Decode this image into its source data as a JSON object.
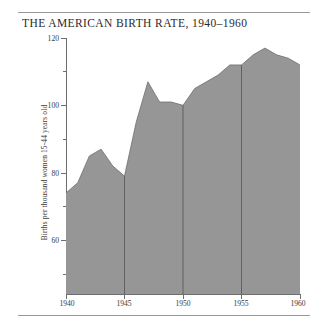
{
  "chart_data": {
    "type": "area",
    "title": "THE AMERICAN BIRTH RATE, 1940–1960",
    "xlabel": "",
    "ylabel": "Births per thousand women 15-44 years old",
    "xlim": [
      1940,
      1960
    ],
    "ylim": [
      50,
      126
    ],
    "grid": "vertical gridlines at 1945, 1950, 1955",
    "legend": "none",
    "fill_color": "#969696",
    "line_color": "#6e6e6e",
    "x_tick_labels": [
      "1940",
      "1945",
      "1950",
      "1955",
      "1960"
    ],
    "x_ticks": [
      1940,
      1945,
      1950,
      1955,
      1960
    ],
    "y_tick_labels": [
      "120",
      "100",
      "80",
      "60"
    ],
    "y_ticks": [
      120,
      100,
      80,
      60
    ],
    "y_minor_ticks": [
      110,
      90,
      70,
      50
    ],
    "x": [
      1940,
      1941,
      1942,
      1943,
      1944,
      1945,
      1946,
      1947,
      1948,
      1949,
      1950,
      1951,
      1952,
      1953,
      1954,
      1955,
      1956,
      1957,
      1958,
      1959,
      1960
    ],
    "values": [
      80,
      83,
      91,
      93,
      88,
      85,
      101,
      113,
      107,
      107,
      106,
      111,
      113,
      115,
      118,
      118,
      121,
      123,
      121,
      120,
      118
    ],
    "series": [
      {
        "name": "Births per thousand women 15-44 years old",
        "values": [
          80,
          83,
          91,
          93,
          88,
          85,
          101,
          113,
          107,
          107,
          106,
          111,
          113,
          115,
          118,
          118,
          121,
          123,
          121,
          120,
          118
        ]
      }
    ]
  },
  "figure": {
    "title": "THE AMERICAN BIRTH RATE, 1940–1960",
    "ylabel": "Births per thousand women 15-44 years old"
  },
  "axes": {
    "y_labels": [
      "120",
      "100",
      "80",
      "60"
    ],
    "x_labels": [
      "1940",
      "1945",
      "1950",
      "1955",
      "1960"
    ]
  }
}
